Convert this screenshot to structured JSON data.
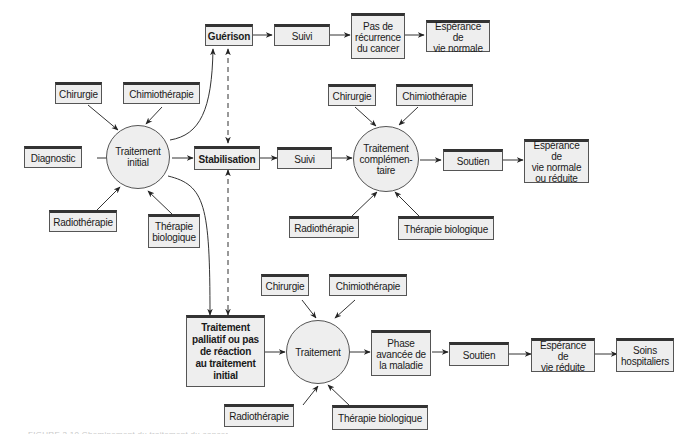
{
  "diagram": {
    "type": "flowchart",
    "colors": {
      "box_fill": "#eeeeee",
      "border": "#555555",
      "border_top": "#333333",
      "line": "#333333"
    },
    "top_row": {
      "guerison": "Guérison",
      "suivi": "Suivi",
      "pas_recurrence": "Pas de\nrécurrence\ndu cancer",
      "esperance_normale": "Espérance de\nvie normale"
    },
    "initial": {
      "diagnostic": "Diagnostic",
      "chirurgie": "Chirurgie",
      "chimiotherapie": "Chimiothérapie",
      "radiotherapie": "Radiothérapie",
      "therapie_biologique": "Thérapie\nbiologique",
      "circle": "Traitement\ninitial"
    },
    "middle_row": {
      "stabilisation": "Stabilisation",
      "suivi": "Suivi",
      "chirurgie": "Chirurgie",
      "chimiotherapie": "Chimiothérapie",
      "radiotherapie": "Radiothérapie",
      "therapie_biologique": "Thérapie biologique",
      "circle": "Traitement\ncomplémen-\ntaire",
      "soutien": "Soutien",
      "esperance": "Espérance de\nvie normale\nou réduite"
    },
    "bottom_row": {
      "palliatif": "Traitement\npalliatif ou pas\nde réaction\nau traitement\ninitial",
      "chirurgie": "Chirurgie",
      "chimiotherapie": "Chimiothérapie",
      "radiotherapie": "Radiothérapie",
      "therapie_biologique": "Thérapie biologique",
      "circle": "Traitement",
      "phase_avancee": "Phase\navancée de\nla maladie",
      "soutien": "Soutien",
      "esperance_reduite": "Espérance de\nvie réduite",
      "soins": "Soins\nhospitaliers"
    },
    "caption": "FIGURE 2.10 Cheminement du traitement du cancer"
  }
}
